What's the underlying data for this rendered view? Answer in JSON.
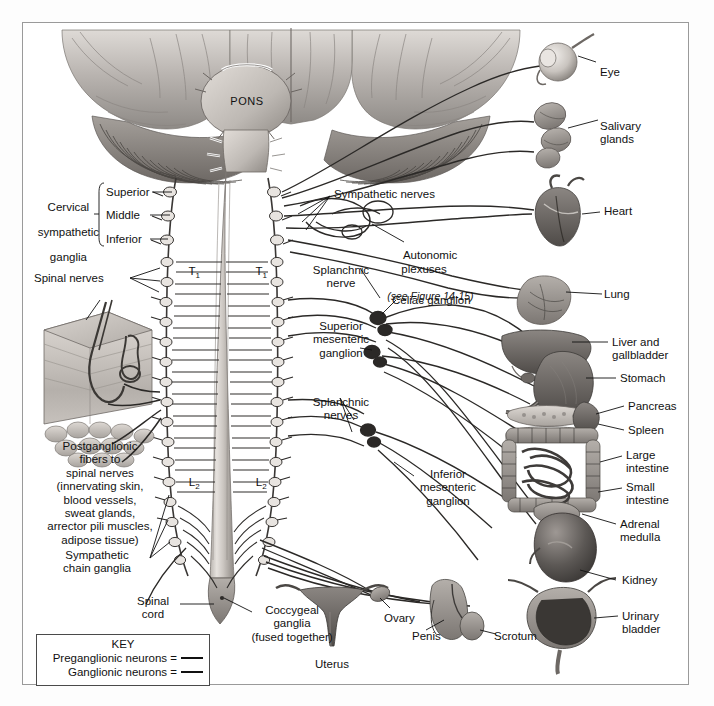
{
  "figure": {
    "background_color": "#ffffff",
    "frame_color": "#9a9a9a",
    "ink_color": "#111111"
  },
  "brain": {
    "pons_label": "PONS"
  },
  "spinal_levels": {
    "t1_left": "T",
    "t1_left_sub": "1",
    "t1_right": "T",
    "t1_right_sub": "1",
    "l2_left": "L",
    "l2_left_sub": "2",
    "l2_right": "L",
    "l2_right_sub": "2"
  },
  "left_labels": {
    "cervical_ganglia_title_line1": "Cervical",
    "cervical_ganglia_title_line2": "sympathetic",
    "cervical_ganglia_title_line3": "ganglia",
    "superior": "Superior",
    "middle": "Middle",
    "inferior": "Inferior",
    "spinal_nerves": "Spinal nerves",
    "postganglionic_block": "Postganglionic\nfibers to\nspinal nerves\n(innervating skin,\nblood vessels,\nsweat glands,\narrector pili muscles,\nadipose tissue)",
    "sympathetic_chain_ganglia": "Sympathetic\nchain ganglia",
    "spinal_cord": "Spinal\ncord"
  },
  "center_labels": {
    "sympathetic_nerves": "Sympathetic nerves",
    "autonomic_plexuses": "Autonomic\nplexuses",
    "autonomic_plexuses_ref": "(see Figure 14-15)",
    "splanchnic_nerve": "Splanchnic\nnerve",
    "celiac_ganglion": "Celiac ganglion",
    "superior_mesenteric_ganglion": "Superior\nmesenteric\nganglion",
    "splanchnic_nerves": "Splanchnic\nnerves",
    "inferior_mesenteric_ganglion": "Inferior\nmesenteric\nganglion",
    "coccygeal_ganglia": "Coccygeal\nganglia\n(fused together)"
  },
  "right_labels": {
    "eye": "Eye",
    "salivary_glands": "Salivary\nglands",
    "heart": "Heart",
    "lung": "Lung",
    "liver_and_gallbladder": "Liver and\ngallbladder",
    "stomach": "Stomach",
    "pancreas": "Pancreas",
    "spleen": "Spleen",
    "large_intestine": "Large\nintestine",
    "small_intestine": "Small\nintestine",
    "adrenal_medulla": "Adrenal\nmedulla",
    "kidney": "Kidney",
    "urinary_bladder": "Urinary\nbladder"
  },
  "bottom_labels": {
    "uterus": "Uterus",
    "ovary": "Ovary",
    "penis": "Penis",
    "scrotum": "Scrotum"
  },
  "key": {
    "title": "KEY",
    "preganglionic": "Preganglionic neurons =",
    "ganglionic": "Ganglionic neurons =",
    "preganglionic_color": "#111111",
    "ganglionic_color": "#111111"
  }
}
